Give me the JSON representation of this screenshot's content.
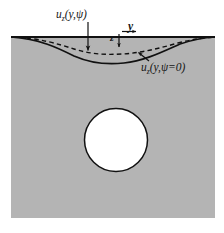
{
  "figure": {
    "colors": {
      "solid_background": "#b4b4b4",
      "cavity_fill": "#ffffff",
      "line_color": "#111111",
      "page_background": "#ffffff"
    },
    "solid_block": {
      "left": 11,
      "right": 215,
      "top": 37,
      "bottom": 218
    },
    "cavity": {
      "shape": "circle",
      "center_x": 116,
      "center_y": 140,
      "radius": 31.5
    },
    "free_surface": {
      "y": 37,
      "left": 11,
      "right": 215
    },
    "curves": [
      {
        "name": "displacement-curve-dashed",
        "style": "dashed",
        "label_ref": "uz_psi",
        "max_depth_px": 15,
        "points": "M11,37 C40,38 58,44 74,49 C90,54 104,55 122,54 C142,53 160,48 178,43 C192,39.5 204,37.6 215,37"
      },
      {
        "name": "displacement-curve-solid",
        "style": "solid",
        "label_ref": "uz_psi_zero",
        "max_depth_px": 25,
        "points": "M11,37 C40,39 58,48 74,56 C90,63 106,65 124,63 C144,61 162,52 180,44 C193,39.5 205,37.5 215,37"
      }
    ],
    "labels": {
      "uz_psi": {
        "base": "u",
        "subscript": "z",
        "args": "(y,ψ)",
        "full_text": "u_z(y,ψ)",
        "x": 56,
        "y": 9
      },
      "uz_psi_zero": {
        "base": "u",
        "subscript": "z",
        "args": "(y,ψ=0)",
        "full_text": "u_z(y,ψ=0)",
        "x": 141,
        "y": 62
      },
      "y_axis": {
        "text": "y",
        "x": 128,
        "y": 21
      },
      "z_axis": {
        "text": "z",
        "x": 110,
        "y": 34
      }
    },
    "leaders": [
      {
        "name": "leader-uz-psi",
        "from_x": 88,
        "from_y": 22,
        "to_x": 88,
        "to_y": 50,
        "arrowhead": "end"
      },
      {
        "name": "leader-uz-psi-zero",
        "from_x": 148,
        "from_y": 61,
        "to_x": 139,
        "to_y": 53,
        "arrowhead": "end"
      }
    ],
    "axes": [
      {
        "name": "y-axis-arrow",
        "direction": "right",
        "from_x": 123,
        "from_y": 32,
        "to_x": 137,
        "to_y": 32
      },
      {
        "name": "z-axis-arrow",
        "direction": "down",
        "from_x": 119,
        "from_y": 34,
        "to_x": 119,
        "to_y": 48
      }
    ]
  }
}
